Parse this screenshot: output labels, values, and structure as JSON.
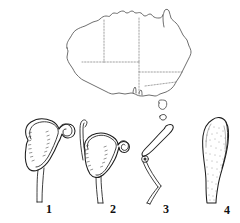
{
  "plate": {
    "background_color": "#ffffff",
    "ink_color": "#1d1d1d",
    "map": {
      "name": "Australia",
      "coast_color": "#4a4a4a",
      "border_style": "dotted",
      "border_color": "#7a7a7a",
      "includes_tasmania": true
    },
    "figures": [
      {
        "label": "1",
        "icon": "hooded-labellum-icon",
        "description": "hooded structure with incurved margins and inrolled column, tapering stalk"
      },
      {
        "label": "2",
        "icon": "hooded-labellum-with-tail-icon",
        "description": "hooded structure with long erect filiform tail and stalk"
      },
      {
        "label": "3",
        "icon": "bent-column-icon",
        "description": "slender sharply bent zigzag structure with small node at the bend"
      },
      {
        "label": "4",
        "icon": "club-shaped-organ-icon",
        "description": "club-shaped stippled organ narrowing to the base"
      }
    ]
  }
}
